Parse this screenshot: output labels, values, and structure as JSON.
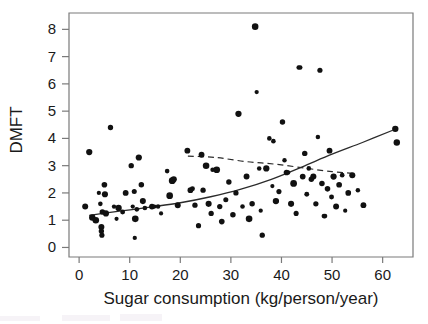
{
  "figure": {
    "background_color": "#ffffff",
    "foreground_color": "#111111",
    "frame_color": "#7a7a7a"
  },
  "chart_data": {
    "type": "scatter",
    "title": "",
    "subtitle": "",
    "xlabel": "Sugar consumption (kg/person/year)",
    "ylabel": "DMFT",
    "xlim": [
      -2,
      66
    ],
    "ylim": [
      -0.35,
      8.6
    ],
    "xticks": [
      0,
      10,
      20,
      30,
      40,
      50,
      60
    ],
    "xtick_labels": [
      "0",
      "10",
      "20",
      "30",
      "40",
      "50",
      "60"
    ],
    "yticks": [
      0,
      1,
      2,
      3,
      4,
      5,
      6,
      7,
      8
    ],
    "ytick_labels": [
      "0",
      "1",
      "2",
      "3",
      "4",
      "5",
      "6",
      "7",
      "8"
    ],
    "grid": false,
    "legend": null,
    "legend_position": "none",
    "annotations": [],
    "series": [
      {
        "name": "Countries",
        "type": "scatter",
        "marker": "circle",
        "color": "#111111",
        "points": [
          [
            1.2,
            1.5
          ],
          [
            2.0,
            3.5
          ],
          [
            2.6,
            1.1
          ],
          [
            3.3,
            1.0
          ],
          [
            3.9,
            2.0
          ],
          [
            4.2,
            1.6
          ],
          [
            4.4,
            0.75
          ],
          [
            4.4,
            0.6
          ],
          [
            4.5,
            0.45
          ],
          [
            4.6,
            1.3
          ],
          [
            5.0,
            2.3
          ],
          [
            5.1,
            1.95
          ],
          [
            5.3,
            1.25
          ],
          [
            6.2,
            4.4
          ],
          [
            6.9,
            1.5
          ],
          [
            7.4,
            1.05
          ],
          [
            7.8,
            1.45
          ],
          [
            8.6,
            1.3
          ],
          [
            9.2,
            2.0
          ],
          [
            10.3,
            3.0
          ],
          [
            10.6,
            1.5
          ],
          [
            10.9,
            2.05
          ],
          [
            11.0,
            0.35
          ],
          [
            11.1,
            1.05
          ],
          [
            11.4,
            1.4
          ],
          [
            11.8,
            3.3
          ],
          [
            12.3,
            2.3
          ],
          [
            12.6,
            1.7
          ],
          [
            13.0,
            1.45
          ],
          [
            14.4,
            1.5
          ],
          [
            14.9,
            1.5
          ],
          [
            15.6,
            1.5
          ],
          [
            16.2,
            1.25
          ],
          [
            17.4,
            2.8
          ],
          [
            17.9,
            1.9
          ],
          [
            18.4,
            2.45
          ],
          [
            18.7,
            2.5
          ],
          [
            19.5,
            1.55
          ],
          [
            21.4,
            3.55
          ],
          [
            22.0,
            2.1
          ],
          [
            22.4,
            2.15
          ],
          [
            22.9,
            1.55
          ],
          [
            23.6,
            0.8
          ],
          [
            24.2,
            3.4
          ],
          [
            24.5,
            2.1
          ],
          [
            25.1,
            3.0
          ],
          [
            25.6,
            1.6
          ],
          [
            26.1,
            1.25
          ],
          [
            26.4,
            2.85
          ],
          [
            27.2,
            2.85
          ],
          [
            27.8,
            1.5
          ],
          [
            28.2,
            0.95
          ],
          [
            29.0,
            1.75
          ],
          [
            29.6,
            2.4
          ],
          [
            30.4,
            1.2
          ],
          [
            31.0,
            2.0
          ],
          [
            31.5,
            4.9
          ],
          [
            32.3,
            1.5
          ],
          [
            33.1,
            2.6
          ],
          [
            33.6,
            1.05
          ],
          [
            34.2,
            1.6
          ],
          [
            34.8,
            8.1
          ],
          [
            35.1,
            5.7
          ],
          [
            35.6,
            2.9
          ],
          [
            35.9,
            1.35
          ],
          [
            36.2,
            0.45
          ],
          [
            37.0,
            2.9
          ],
          [
            37.6,
            4.0
          ],
          [
            38.2,
            2.25
          ],
          [
            38.4,
            3.9
          ],
          [
            38.9,
            1.7
          ],
          [
            39.5,
            2.05
          ],
          [
            40.2,
            4.6
          ],
          [
            40.6,
            3.2
          ],
          [
            41.0,
            2.75
          ],
          [
            41.3,
            2.75
          ],
          [
            41.9,
            1.6
          ],
          [
            42.4,
            2.35
          ],
          [
            42.9,
            1.25
          ],
          [
            43.4,
            6.6
          ],
          [
            43.7,
            6.6
          ],
          [
            44.2,
            2.6
          ],
          [
            44.6,
            3.45
          ],
          [
            45.0,
            1.95
          ],
          [
            45.4,
            2.9
          ],
          [
            45.9,
            2.5
          ],
          [
            46.3,
            2.6
          ],
          [
            46.8,
            1.6
          ],
          [
            47.2,
            4.05
          ],
          [
            47.6,
            6.5
          ],
          [
            48.0,
            2.35
          ],
          [
            48.4,
            1.15
          ],
          [
            48.6,
            1.15
          ],
          [
            49.1,
            2.15
          ],
          [
            49.5,
            3.55
          ],
          [
            49.9,
            1.85
          ],
          [
            50.3,
            2.6
          ],
          [
            50.8,
            1.5
          ],
          [
            51.4,
            2.3
          ],
          [
            52.0,
            2.65
          ],
          [
            52.6,
            1.35
          ],
          [
            53.2,
            2.0
          ],
          [
            54.0,
            2.65
          ],
          [
            55.1,
            2.1
          ],
          [
            56.2,
            1.55
          ],
          [
            62.5,
            4.35
          ],
          [
            62.8,
            3.85
          ]
        ]
      },
      {
        "name": "Fitted trend (all data)",
        "type": "line",
        "style": "solid",
        "color": "#2b2b2b",
        "points": [
          [
            2.0,
            1.18
          ],
          [
            8.0,
            1.33
          ],
          [
            14.0,
            1.48
          ],
          [
            20.0,
            1.64
          ],
          [
            26.0,
            1.86
          ],
          [
            32.0,
            2.14
          ],
          [
            38.0,
            2.5
          ],
          [
            44.0,
            2.95
          ],
          [
            50.0,
            3.42
          ],
          [
            56.0,
            3.85
          ],
          [
            62.0,
            4.3
          ]
        ]
      },
      {
        "name": "Fitted trend (restricted range)",
        "type": "line",
        "style": "dashed",
        "color": "#2b2b2b",
        "points": [
          [
            21.5,
            3.35
          ],
          [
            27.0,
            3.3
          ],
          [
            33.0,
            3.15
          ],
          [
            39.0,
            3.05
          ],
          [
            45.0,
            2.9
          ],
          [
            50.0,
            2.78
          ],
          [
            54.0,
            2.72
          ]
        ]
      }
    ]
  }
}
